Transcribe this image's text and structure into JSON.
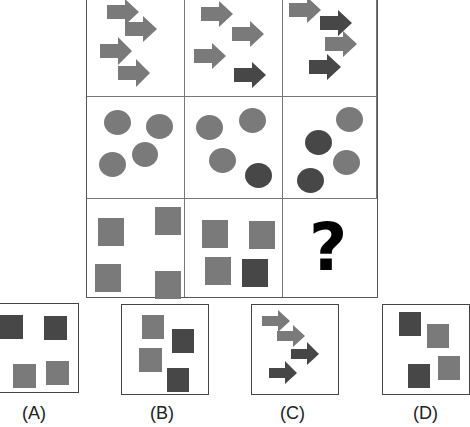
{
  "puzzle": {
    "question_mark": "?",
    "colors": {
      "light": "#7a7a7a",
      "dark": "#474747",
      "border": "#555555"
    },
    "rows": [
      {
        "shape": "arrow",
        "cells": [
          {
            "items": [
              "light",
              "light",
              "light",
              "light"
            ]
          },
          {
            "items": [
              "light",
              "light",
              "light",
              "dark"
            ]
          },
          {
            "items": [
              "light",
              "dark",
              "light",
              "dark"
            ]
          }
        ]
      },
      {
        "shape": "circle",
        "cells": [
          {
            "items": [
              "light",
              "light",
              "light",
              "light"
            ]
          },
          {
            "items": [
              "light",
              "light",
              "light",
              "dark"
            ]
          },
          {
            "items": [
              "light",
              "dark",
              "light",
              "dark"
            ]
          }
        ]
      },
      {
        "shape": "square",
        "cells": [
          {
            "items": [
              "light",
              "light",
              "light",
              "light"
            ]
          },
          {
            "items": [
              "light",
              "light",
              "light",
              "dark"
            ]
          },
          {
            "items": [
              "missing"
            ]
          }
        ]
      }
    ]
  },
  "options": [
    {
      "label": "(A)",
      "shape": "square",
      "items": [
        "dark",
        "dark",
        "light",
        "light"
      ]
    },
    {
      "label": "(B)",
      "shape": "square",
      "items": [
        "light",
        "dark",
        "light",
        "dark"
      ]
    },
    {
      "label": "(C)",
      "shape": "arrow",
      "items": [
        "light",
        "light",
        "dark",
        "dark"
      ]
    },
    {
      "label": "(D)",
      "shape": "square",
      "items": [
        "dark",
        "light",
        "dark",
        "light"
      ]
    }
  ]
}
